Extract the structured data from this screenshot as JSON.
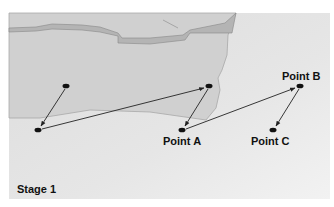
{
  "stage_label": "Stage 1",
  "points": {
    "a": {
      "label": "Point A"
    },
    "b": {
      "label": "Point B"
    },
    "c": {
      "label": "Point C"
    }
  },
  "colors": {
    "panel_bg": "#e2e2e2",
    "landmass": "#d0d0d0",
    "landmass_edge": "#a8a8a8",
    "rock_band": "#b4b4b4",
    "dot": "#111111",
    "arrow": "#222222"
  }
}
